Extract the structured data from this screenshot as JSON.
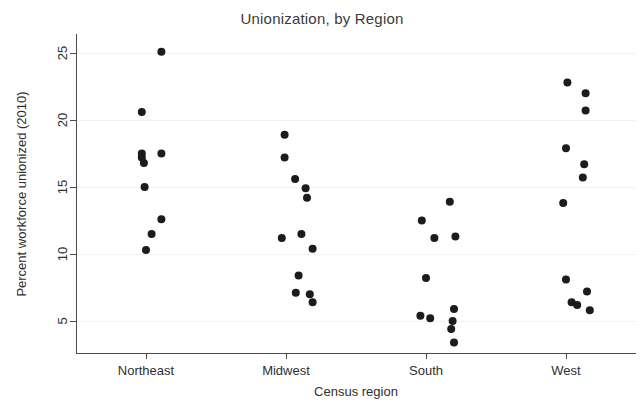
{
  "chart_data": {
    "type": "scatter",
    "title": "Unionization, by Region",
    "xlabel": "Census region",
    "ylabel": "Percent workforce unionized (2010)",
    "categories": [
      "Northeast",
      "Midwest",
      "South",
      "West"
    ],
    "xtick_labels": [
      "Northeast",
      "Midwest",
      "South",
      "West"
    ],
    "ytick_labels": [
      "5",
      "10",
      "15",
      "20",
      "25"
    ],
    "yticks": [
      5,
      10,
      15,
      20,
      25
    ],
    "ylim": [
      2.5,
      26.5
    ],
    "grid": "horizontal-faint",
    "legend": "none",
    "marker": "filled-circle",
    "marker_color": "#1c1c1c",
    "marker_size_px": 7,
    "jitter": "horizontal",
    "series": [
      {
        "name": "Northeast",
        "points": [
          {
            "x_offset": 0.22,
            "y": 25.1
          },
          {
            "x_offset": -0.06,
            "y": 20.6
          },
          {
            "x_offset": -0.06,
            "y": 17.5
          },
          {
            "x_offset": 0.22,
            "y": 17.5
          },
          {
            "x_offset": -0.06,
            "y": 17.2
          },
          {
            "x_offset": -0.03,
            "y": 16.8
          },
          {
            "x_offset": -0.02,
            "y": 15.0
          },
          {
            "x_offset": 0.22,
            "y": 12.6
          },
          {
            "x_offset": 0.08,
            "y": 11.5
          },
          {
            "x_offset": 0.0,
            "y": 10.3
          }
        ]
      },
      {
        "name": "Midwest",
        "points": [
          {
            "x_offset": -0.02,
            "y": 18.9
          },
          {
            "x_offset": -0.02,
            "y": 17.2
          },
          {
            "x_offset": 0.13,
            "y": 15.6
          },
          {
            "x_offset": 0.28,
            "y": 14.9
          },
          {
            "x_offset": 0.3,
            "y": 14.2
          },
          {
            "x_offset": 0.22,
            "y": 11.5
          },
          {
            "x_offset": -0.06,
            "y": 11.2
          },
          {
            "x_offset": 0.38,
            "y": 10.4
          },
          {
            "x_offset": 0.18,
            "y": 8.4
          },
          {
            "x_offset": 0.14,
            "y": 7.1
          },
          {
            "x_offset": 0.34,
            "y": 7.0
          },
          {
            "x_offset": 0.38,
            "y": 6.4
          }
        ]
      },
      {
        "name": "South",
        "points": [
          {
            "x_offset": 0.34,
            "y": 13.9
          },
          {
            "x_offset": -0.06,
            "y": 12.5
          },
          {
            "x_offset": 0.12,
            "y": 11.2
          },
          {
            "x_offset": 0.42,
            "y": 11.3
          },
          {
            "x_offset": 0.0,
            "y": 8.2
          },
          {
            "x_offset": 0.4,
            "y": 5.9
          },
          {
            "x_offset": -0.08,
            "y": 5.4
          },
          {
            "x_offset": 0.06,
            "y": 5.2
          },
          {
            "x_offset": 0.38,
            "y": 5.0
          },
          {
            "x_offset": 0.36,
            "y": 4.4
          },
          {
            "x_offset": 0.4,
            "y": 3.4
          }
        ]
      },
      {
        "name": "West",
        "points": [
          {
            "x_offset": 0.02,
            "y": 22.8
          },
          {
            "x_offset": 0.28,
            "y": 22.0
          },
          {
            "x_offset": 0.28,
            "y": 20.7
          },
          {
            "x_offset": 0.0,
            "y": 17.9
          },
          {
            "x_offset": 0.26,
            "y": 16.7
          },
          {
            "x_offset": 0.24,
            "y": 15.7
          },
          {
            "x_offset": -0.04,
            "y": 13.8
          },
          {
            "x_offset": 0.0,
            "y": 8.1
          },
          {
            "x_offset": 0.3,
            "y": 7.2
          },
          {
            "x_offset": 0.08,
            "y": 6.4
          },
          {
            "x_offset": 0.16,
            "y": 6.2
          },
          {
            "x_offset": 0.34,
            "y": 5.8
          }
        ]
      }
    ]
  },
  "plot_geometry": {
    "left_px": 76,
    "right_px": 636,
    "top_px": 34,
    "bottom_px": 353,
    "y_value_at_bottom_tick": 5,
    "px_per_unit": 13.4
  }
}
